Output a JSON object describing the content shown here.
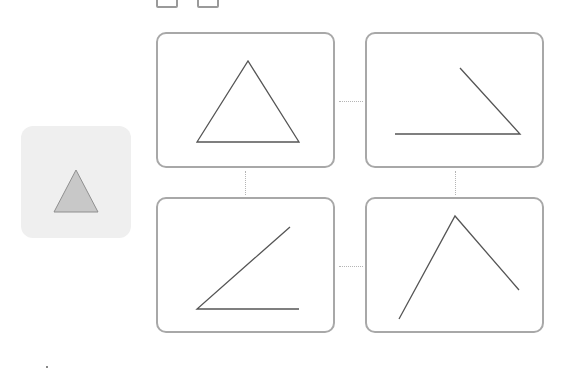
{
  "colors": {
    "card_border": "#a8a8a8",
    "line_stroke": "#555555",
    "reference_bg": "#efefef",
    "reference_fill": "#c8c8c8",
    "connector": "#b5b5b5"
  },
  "reference": {
    "shape": "filled-triangle",
    "points": "33,86 55,44 77,86"
  },
  "cards": [
    {
      "id": "top-left",
      "shape": "triangle",
      "polyline": "39,108 90,27 141,108",
      "closed": true
    },
    {
      "id": "top-right",
      "shape": "angle-acute-right",
      "polyline": "28,100 153,100 93,34",
      "closed": false
    },
    {
      "id": "bottom-left",
      "shape": "angle-acute-left",
      "polyline": "132,28 39,110 141,110",
      "closed": false
    },
    {
      "id": "bottom-right",
      "shape": "angle-peak",
      "polyline": "32,120 88,17 152,91",
      "closed": false
    }
  ]
}
